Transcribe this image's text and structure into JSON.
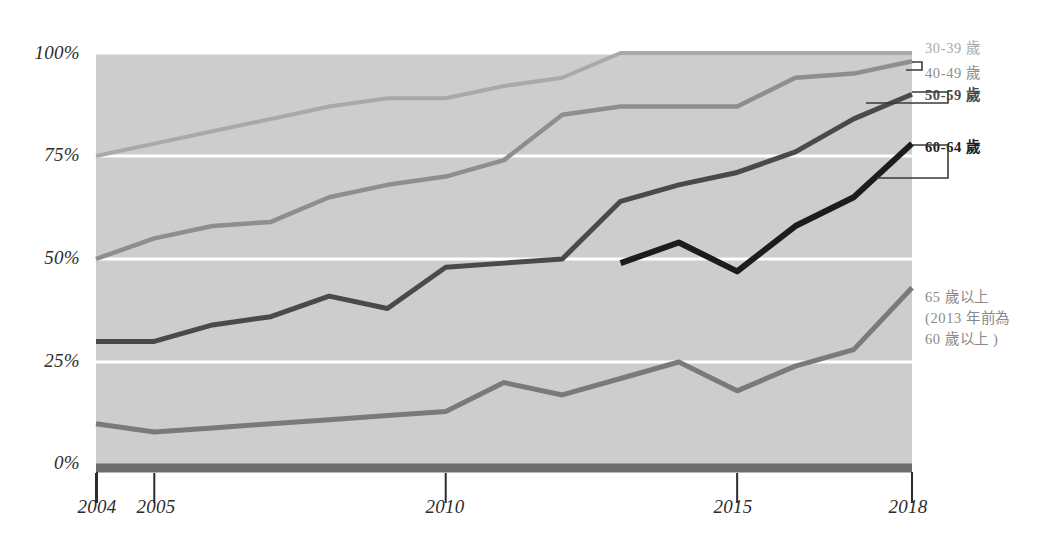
{
  "chart_data": {
    "type": "line",
    "title": "",
    "xlabel": "",
    "ylabel": "",
    "x": [
      2004,
      2005,
      2006,
      2007,
      2008,
      2009,
      2010,
      2011,
      2012,
      2013,
      2014,
      2015,
      2016,
      2017,
      2018
    ],
    "xtick_labels": [
      "2004",
      "2005",
      "2010",
      "2015",
      "2018"
    ],
    "xtick_values": [
      2004,
      2005,
      2010,
      2015,
      2018
    ],
    "ytick_labels": [
      "0%",
      "25%",
      "50%",
      "75%",
      "100%"
    ],
    "ytick_values": [
      0,
      25,
      50,
      75,
      100
    ],
    "ylim": [
      0,
      100
    ],
    "xlim": [
      2004,
      2018
    ],
    "grid": "horizontal-white",
    "legend_position": "right-callouts",
    "plot_background": "#cdcdcd",
    "series": [
      {
        "name": "30-39 歲",
        "color": "#a9a9a9",
        "width": 4,
        "values": [
          75,
          78,
          81,
          84,
          87,
          89,
          89,
          92,
          94,
          100,
          100,
          100,
          100,
          100,
          100
        ]
      },
      {
        "name": "40-49 歲",
        "color": "#8e8e8e",
        "width": 4.5,
        "values": [
          50,
          55,
          58,
          59,
          65,
          68,
          70,
          74,
          85,
          87,
          87,
          87,
          94,
          95,
          98
        ]
      },
      {
        "name": "50-59 歲",
        "color": "#4a4a4a",
        "width": 5,
        "values": [
          30,
          30,
          34,
          36,
          41,
          38,
          48,
          49,
          50,
          64,
          68,
          71,
          76,
          84,
          90
        ]
      },
      {
        "name": "60-64 歲",
        "color": "#1c1c1c",
        "width": 6,
        "values": [
          null,
          null,
          null,
          null,
          null,
          null,
          null,
          null,
          null,
          49,
          54,
          47,
          58,
          65,
          78
        ]
      },
      {
        "name": "65 歲以上",
        "color": "#7a7a7a",
        "width": 5,
        "values": [
          10,
          8,
          9,
          10,
          11,
          12,
          13,
          20,
          17,
          21,
          25,
          18,
          24,
          28,
          43
        ]
      }
    ]
  },
  "yaxis": {
    "ticks": [
      {
        "label": "100%"
      },
      {
        "label": "75%"
      },
      {
        "label": "50%"
      },
      {
        "label": "25%"
      },
      {
        "label": "0%"
      }
    ]
  },
  "xaxis": {
    "ticks": [
      {
        "label": "2004"
      },
      {
        "label": "2005"
      },
      {
        "label": "2010"
      },
      {
        "label": "2015"
      },
      {
        "label": "2018"
      }
    ]
  },
  "legend": {
    "items": [
      {
        "label": "30-39 歲"
      },
      {
        "label": "40-49 歲"
      },
      {
        "label": "50-59 歲"
      },
      {
        "label": "60-64 歲"
      }
    ],
    "note": {
      "line1": "65 歲以上",
      "line2": "(2013 年前為",
      "line3": "60 歲以上 )"
    }
  }
}
